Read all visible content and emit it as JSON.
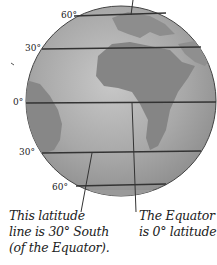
{
  "diagram": {
    "latitude_labels": [
      {
        "id": "n60",
        "text": "60°"
      },
      {
        "id": "n30",
        "text": "30°"
      },
      {
        "id": "eq",
        "text": "0°"
      },
      {
        "id": "s30",
        "text": "30°"
      },
      {
        "id": "s60",
        "text": "60°"
      }
    ],
    "captions": {
      "left": [
        "This latitude",
        "line is 30° South",
        "(of the Equator)."
      ],
      "right": [
        "The Equator",
        "is 0° latitude."
      ]
    },
    "colors": {
      "ocean": "#a9a9a9",
      "land": "#8a8a8a",
      "lines": "#333333",
      "text": "#222222"
    }
  }
}
